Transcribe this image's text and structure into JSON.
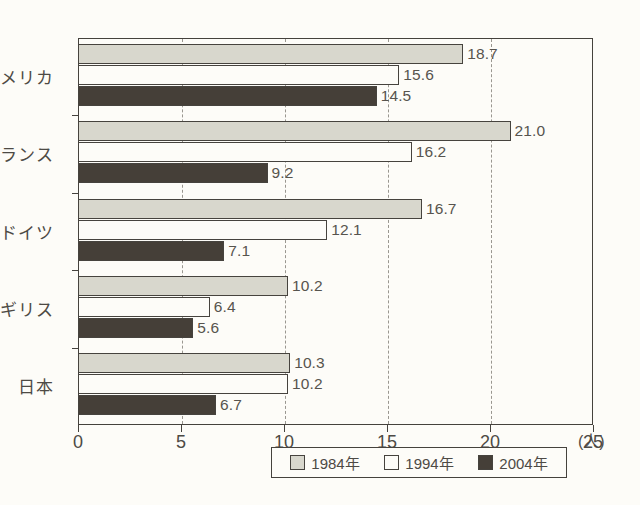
{
  "chart_data": {
    "type": "bar",
    "orientation": "horizontal",
    "title": "",
    "xlabel": "(人)",
    "ylabel": "",
    "xlim": [
      0,
      25
    ],
    "xticks": [
      0,
      5,
      10,
      15,
      20,
      25
    ],
    "xtick_labels": [
      "0",
      "5",
      "10",
      "15",
      "20",
      "25"
    ],
    "grid": "vertical-dashed",
    "legend_position": "bottom",
    "categories": [
      "アメリカ",
      "フランス",
      "ドイツ",
      "イギリス",
      "日本"
    ],
    "series": [
      {
        "name": "1984年",
        "color": "#d8d7cd",
        "values": [
          18.7,
          21.0,
          16.7,
          10.2,
          10.3
        ],
        "labels": [
          "18.7",
          "21.0",
          "16.7",
          "10.2",
          "10.3"
        ]
      },
      {
        "name": "1994年",
        "color": "#fdfcf8",
        "values": [
          15.6,
          16.2,
          12.1,
          6.4,
          10.2
        ],
        "labels": [
          "15.6",
          "16.2",
          "12.1",
          "6.4",
          "10.2"
        ]
      },
      {
        "name": "2004年",
        "color": "#453f38",
        "values": [
          14.5,
          9.2,
          7.1,
          5.6,
          6.7
        ],
        "labels": [
          "14.5",
          "9.2",
          "7.1",
          "5.6",
          "6.7"
        ]
      }
    ]
  },
  "legend": {
    "items": [
      {
        "label": "1984年",
        "swatch": "light-gray"
      },
      {
        "label": "1994年",
        "swatch": "white"
      },
      {
        "label": "2004年",
        "swatch": "dark"
      }
    ]
  },
  "axis": {
    "unit_label": "(人)"
  },
  "caption": {
    "text": ""
  }
}
